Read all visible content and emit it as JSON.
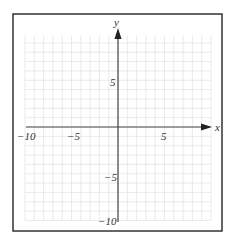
{
  "chart_data": {
    "type": "coordinate-plane",
    "title": "",
    "xlabel": "x",
    "ylabel": "y",
    "xlim": [
      -10,
      10
    ],
    "ylim": [
      -10,
      10
    ],
    "grid": true,
    "grid_step": 1,
    "x_tick_labels": [
      {
        "value": -10,
        "text": "−10"
      },
      {
        "value": -5,
        "text": "−5"
      },
      {
        "value": 5,
        "text": "5"
      }
    ],
    "y_tick_labels": [
      {
        "value": 5,
        "text": "5"
      },
      {
        "value": -5,
        "text": "−5"
      },
      {
        "value": -10,
        "text": "−10"
      }
    ],
    "series": []
  },
  "labels": {
    "x_axis": "x",
    "y_axis": "y",
    "x_neg10": "−10",
    "x_neg5": "−5",
    "x_pos5": "5",
    "y_pos5": "5",
    "y_neg5": "−5",
    "y_neg10": "−10"
  },
  "colors": {
    "grid": "#e4e4e4",
    "axis": "#444444",
    "border": "#333333"
  }
}
